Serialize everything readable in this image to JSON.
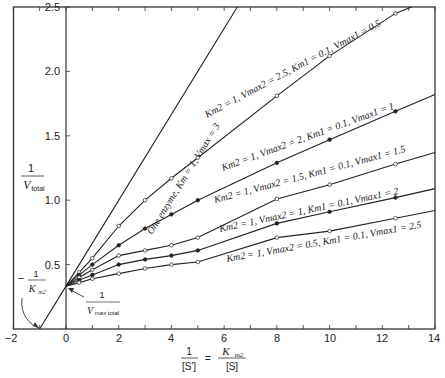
{
  "chart_data": {
    "type": "line",
    "title": "",
    "xlabel": "1/[S'] = Km2/[S]",
    "ylabel": "1/V_total",
    "xlim": [
      -2,
      14
    ],
    "ylim": [
      0,
      2.5
    ],
    "x_ticks": [
      -2,
      0,
      2,
      4,
      6,
      8,
      10,
      12,
      14
    ],
    "y_ticks": [
      0.5,
      1.0,
      1.5,
      2.0,
      2.5
    ],
    "grid": false,
    "legend": "inline labels along lines",
    "series": [
      {
        "name": "One enzyme, Km = 1, Vmax = 3",
        "marker": "none",
        "x": [
          -1,
          0,
          6.5
        ],
        "y": [
          0,
          0.333,
          2.5
        ]
      },
      {
        "name": "Km2 = 1, Vmax2 = 2.5, Km1 = 0.1, Vmax1 = 0.5",
        "marker": "open-circle",
        "x": [
          0,
          0.5,
          1,
          2,
          3,
          4,
          5,
          8,
          10,
          12.5,
          13.1
        ],
        "y": [
          0.333,
          0.44,
          0.55,
          0.8,
          1.0,
          1.17,
          1.33,
          1.81,
          2.12,
          2.45,
          2.5
        ]
      },
      {
        "name": "Km2 = 1, Vmax2 = 2, Km1 = 0.1, Vmax1 = 1",
        "marker": "filled-circle",
        "x": [
          0,
          0.5,
          1,
          2,
          3,
          4,
          5,
          8,
          10,
          12.5,
          14
        ],
        "y": [
          0.333,
          0.42,
          0.5,
          0.65,
          0.78,
          0.89,
          1.0,
          1.29,
          1.47,
          1.69,
          1.82
        ]
      },
      {
        "name": "Km2 = 1, Vmax2 = 1.5, Km1 = 0.1, Vmax1 = 1.5",
        "marker": "half-circle",
        "x": [
          0,
          0.5,
          1,
          2,
          3,
          4,
          5,
          8,
          10,
          12.5,
          14
        ],
        "y": [
          0.333,
          0.4,
          0.46,
          0.57,
          0.61,
          0.65,
          0.71,
          1.01,
          1.12,
          1.28,
          1.37
        ]
      },
      {
        "name": "Km2 = 1, Vmax2 = 1, Km1 = 0.1, Vmax1 = 2",
        "marker": "filled-circle",
        "x": [
          0,
          0.5,
          1,
          2,
          3,
          4,
          5,
          8,
          10,
          12.5,
          14
        ],
        "y": [
          0.333,
          0.38,
          0.42,
          0.5,
          0.54,
          0.57,
          0.61,
          0.82,
          0.91,
          1.02,
          1.09
        ]
      },
      {
        "name": "Km2 = 1, Vmax2 = 0.5, Km1 = 0.1, Vmax1 = 2.5",
        "marker": "open-circle",
        "x": [
          0,
          0.5,
          1,
          2,
          3,
          4,
          5,
          8,
          10,
          12.5,
          14
        ],
        "y": [
          0.333,
          0.36,
          0.39,
          0.43,
          0.47,
          0.5,
          0.52,
          0.71,
          0.76,
          0.86,
          0.92
        ]
      }
    ],
    "annotations": [
      {
        "text": "-1/Km2",
        "points_to": [
          -1,
          0
        ]
      },
      {
        "text": "1/Vmax_total",
        "points_to": [
          0,
          0.333
        ]
      }
    ]
  },
  "labels": {
    "y_ticks": [
      "2.5",
      "2.0",
      "1.5",
      "1.0",
      "0.5"
    ],
    "x_ticks": [
      "−2",
      "0",
      "2",
      "4",
      "6",
      "8",
      "10",
      "12",
      "14"
    ],
    "ylabel_num": "1",
    "ylabel_den": "V",
    "ylabel_sub": "total",
    "xlabel_left_num": "1",
    "xlabel_left_den": "[S′]",
    "xlabel_eq": "=",
    "xlabel_right_num": "K",
    "xlabel_right_num_sub": "m2",
    "xlabel_right_den": "[S]",
    "ann_km_sign": "−",
    "ann_km_num": "1",
    "ann_km_den": "K",
    "ann_km_sub": "m2",
    "ann_v_num": "1",
    "ann_v_den": "V",
    "ann_v_sub": "max total",
    "line_labels": [
      "One enzyme, Km = 1, Vmax = 3",
      "Km2 = 1, Vmax2 = 2.5, Km1 = 0.1, Vmax1 = 0.5",
      "Km2 = 1, Vmax2 = 2, Km1 = 0.1, Vmax1 = 1",
      "Km2 = 1, Vmax2 = 1.5, Km1 = 0.1, Vmax1 = 1.5",
      "Km2 = 1, Vmax2 = 1, Km1 = 0.1, Vmax1 = 2",
      "Km2 = 1, Vmax2 = 0.5, Km1 = 0.1, Vmax1 = 2.5"
    ]
  }
}
